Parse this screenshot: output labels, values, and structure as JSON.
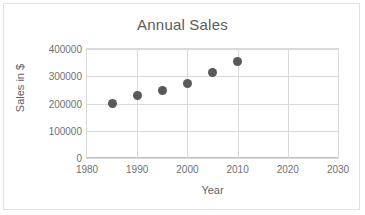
{
  "chart_data": {
    "type": "scatter",
    "title": "Annual Sales",
    "xlabel": "Year",
    "ylabel": "Sales in $",
    "x": [
      1985,
      1990,
      1995,
      2000,
      2005,
      2010
    ],
    "values": [
      200000,
      228000,
      248000,
      275000,
      315000,
      355000
    ],
    "series": [
      {
        "name": "Annual Sales",
        "points": [
          {
            "x": 1985,
            "y": 200000
          },
          {
            "x": 1990,
            "y": 228000
          },
          {
            "x": 1995,
            "y": 248000
          },
          {
            "x": 2000,
            "y": 275000
          },
          {
            "x": 2005,
            "y": 315000
          },
          {
            "x": 2010,
            "y": 355000
          }
        ]
      }
    ],
    "xlim": [
      1980,
      2030
    ],
    "ylim": [
      0,
      400000
    ],
    "xticks": [
      "1980",
      "1990",
      "2000",
      "2010",
      "2020",
      "2030"
    ],
    "xtick_values": [
      1980,
      1990,
      2000,
      2010,
      2020,
      2030
    ],
    "yticks": [
      "400000",
      "300000",
      "200000",
      "100000",
      "0"
    ],
    "ytick_values": [
      400000,
      300000,
      200000,
      100000,
      0
    ],
    "grid": true,
    "legend": false,
    "marker_color": "#595959",
    "gridline_color": "#d9d9d9",
    "text_color": "#707070",
    "title_color": "#5b5b5b",
    "border_color": "#e2e2e2"
  }
}
